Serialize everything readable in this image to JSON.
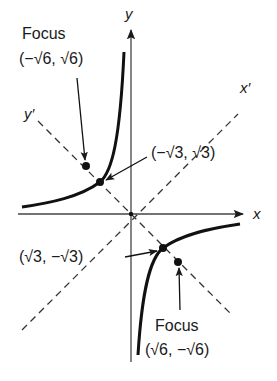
{
  "diagram": {
    "axes": {
      "x_label": "x",
      "y_label": "y",
      "x_prime_label": "x′",
      "y_prime_label": "y′"
    },
    "labels": {
      "focus_upper_word": "Focus",
      "focus_upper_coord": "(−√6, √6)",
      "vertex_upper_coord": "(−√3, √3)",
      "vertex_lower_coord": "(√3, −√3)",
      "focus_lower_word": "Focus",
      "focus_lower_coord": "(√6, −√6)"
    },
    "points": [
      {
        "name": "focus-upper",
        "x": "-√6",
        "y": "√6"
      },
      {
        "name": "vertex-upper",
        "x": "-√3",
        "y": "√3"
      },
      {
        "name": "vertex-lower",
        "x": "√3",
        "y": "-√3"
      },
      {
        "name": "focus-lower",
        "x": "√6",
        "y": "-√6"
      }
    ],
    "colors": {
      "ink": "#1a1a1a",
      "axis": "#444444",
      "background": "#ffffff"
    }
  }
}
